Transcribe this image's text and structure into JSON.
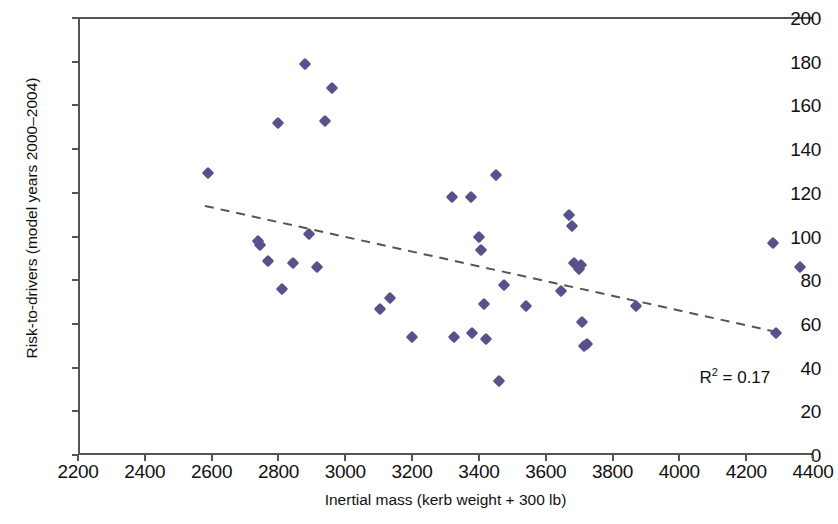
{
  "chart_data": {
    "type": "scatter",
    "title": "",
    "xlabel": "Inertial mass (kerb weight + 300 lb)",
    "ylabel": "Risk-to-drivers (model years 2000–2004)",
    "xlim": [
      2200,
      4400
    ],
    "ylim": [
      0,
      200
    ],
    "xticks": [
      2200,
      2400,
      2600,
      2800,
      3000,
      3200,
      3400,
      3600,
      3800,
      4000,
      4200,
      4400
    ],
    "yticks": [
      0,
      20,
      40,
      60,
      80,
      100,
      120,
      140,
      160,
      180,
      200
    ],
    "grid": false,
    "legend": null,
    "marker_color": "#56538c",
    "annotations": [
      {
        "text_prefix": "R",
        "text_sup": "2",
        "text_suffix": " = 0.17",
        "x": 4060,
        "y": 38
      }
    ],
    "trendline": {
      "style": "dashed",
      "color": "#555555",
      "x": [
        2580,
        4300
      ],
      "y": [
        114,
        56
      ]
    },
    "points": [
      {
        "x": 2590,
        "y": 129
      },
      {
        "x": 2740,
        "y": 98
      },
      {
        "x": 2745,
        "y": 96
      },
      {
        "x": 2770,
        "y": 89
      },
      {
        "x": 2800,
        "y": 152
      },
      {
        "x": 2810,
        "y": 76
      },
      {
        "x": 2845,
        "y": 88
      },
      {
        "x": 2880,
        "y": 179
      },
      {
        "x": 2890,
        "y": 101
      },
      {
        "x": 2915,
        "y": 86
      },
      {
        "x": 2940,
        "y": 153
      },
      {
        "x": 2960,
        "y": 168
      },
      {
        "x": 3105,
        "y": 67
      },
      {
        "x": 3135,
        "y": 72
      },
      {
        "x": 3200,
        "y": 54
      },
      {
        "x": 3320,
        "y": 118
      },
      {
        "x": 3325,
        "y": 54
      },
      {
        "x": 3375,
        "y": 118
      },
      {
        "x": 3380,
        "y": 56
      },
      {
        "x": 3400,
        "y": 100
      },
      {
        "x": 3405,
        "y": 94
      },
      {
        "x": 3415,
        "y": 69
      },
      {
        "x": 3420,
        "y": 53
      },
      {
        "x": 3450,
        "y": 128
      },
      {
        "x": 3460,
        "y": 34
      },
      {
        "x": 3475,
        "y": 78
      },
      {
        "x": 3540,
        "y": 68
      },
      {
        "x": 3645,
        "y": 75
      },
      {
        "x": 3670,
        "y": 110
      },
      {
        "x": 3680,
        "y": 105
      },
      {
        "x": 3685,
        "y": 88
      },
      {
        "x": 3700,
        "y": 85
      },
      {
        "x": 3705,
        "y": 87
      },
      {
        "x": 3710,
        "y": 61
      },
      {
        "x": 3715,
        "y": 50
      },
      {
        "x": 3725,
        "y": 51
      },
      {
        "x": 3870,
        "y": 68
      },
      {
        "x": 4280,
        "y": 97
      },
      {
        "x": 4290,
        "y": 56
      },
      {
        "x": 4360,
        "y": 86
      }
    ]
  }
}
